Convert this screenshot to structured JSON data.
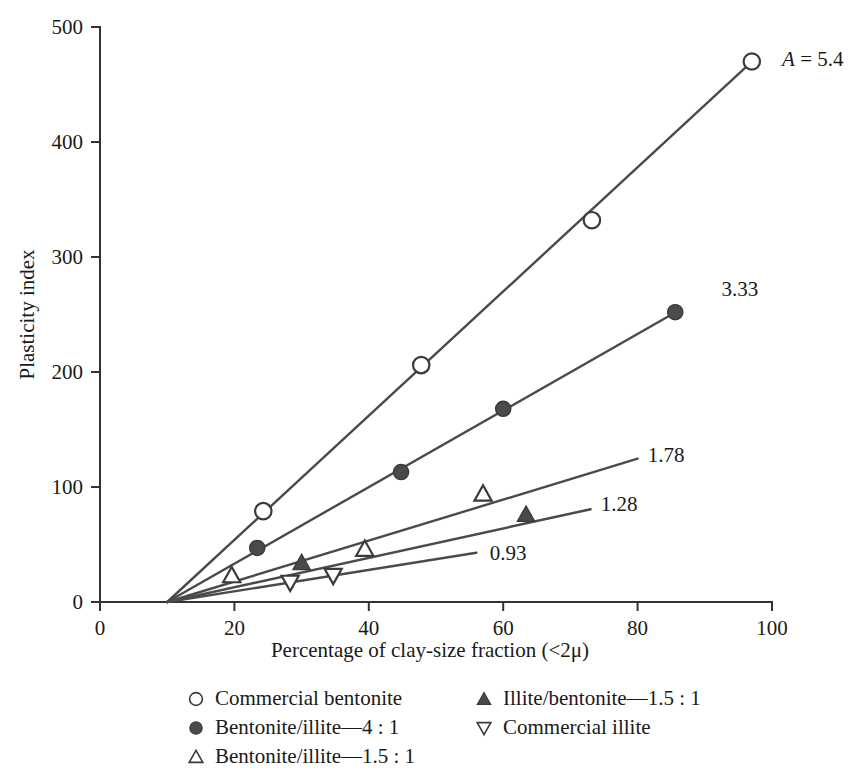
{
  "chart_data": {
    "type": "line",
    "title": "",
    "xlabel": "Percentage of clay-size fraction (<2μ)",
    "ylabel": "Plasticity index",
    "xlim": [
      0,
      100
    ],
    "ylim": [
      0,
      500
    ],
    "xticks": [
      0,
      20,
      40,
      60,
      80,
      100
    ],
    "yticks": [
      0,
      100,
      200,
      300,
      400,
      500
    ],
    "xtick_labels": [
      "0",
      "20",
      "40",
      "60",
      "80",
      "100"
    ],
    "ytick_labels": [
      "0",
      "100",
      "200",
      "300",
      "400",
      "500"
    ],
    "grid": false,
    "legend_position": "below-axes",
    "intercept_x": 10,
    "annotations": [
      {
        "text_italic": "A",
        "text_rest": " = 5.4",
        "x": 101.5,
        "y": 472,
        "full": "A = 5.4"
      },
      {
        "text_italic": "",
        "text_rest": "3.33",
        "x": 92.5,
        "y": 272,
        "full": "3.33"
      },
      {
        "text_italic": "",
        "text_rest": "1.78",
        "x": 81.5,
        "y": 128,
        "full": "1.78"
      },
      {
        "text_italic": "",
        "text_rest": "1.28",
        "x": 74.5,
        "y": 85,
        "full": "1.28"
      },
      {
        "text_italic": "",
        "text_rest": "0.93",
        "x": 58.0,
        "y": 43,
        "full": "0.93"
      }
    ],
    "series": [
      {
        "name": "Commercial bentonite",
        "activity": 5.4,
        "marker": "open-circle",
        "line_x": [
          10,
          97.0
        ],
        "points_x": [
          24.3,
          47.8,
          73.2,
          97.0
        ],
        "points_y": [
          79,
          206,
          332,
          470
        ]
      },
      {
        "name": "Bentonite/illite—4 : 1",
        "activity": 3.33,
        "marker": "filled-circle",
        "line_x": [
          10,
          86.5
        ],
        "points_x": [
          23.4,
          44.8,
          60.0,
          85.6
        ],
        "points_y": [
          47,
          113,
          168,
          252
        ]
      },
      {
        "name": "Bentonite/illite—1.5 : 1",
        "activity": 1.78,
        "marker": "open-triangle-up",
        "line_x": [
          10,
          80.0
        ],
        "points_x": [
          19.6,
          39.4,
          57.0
        ],
        "points_y": [
          23,
          46,
          94
        ]
      },
      {
        "name": "Illite/bentonite—1.5 : 1",
        "activity": 1.28,
        "marker": "filled-triangle-up",
        "line_x": [
          10,
          73.0
        ],
        "points_x": [
          30.0,
          63.4
        ],
        "points_y": [
          34,
          76
        ]
      },
      {
        "name": "Commercial illite",
        "activity": 0.93,
        "marker": "open-triangle-down",
        "line_x": [
          10,
          56.0
        ],
        "points_x": [
          28.3,
          34.7
        ],
        "points_y": [
          17,
          23
        ]
      }
    ]
  },
  "legend": {
    "column_left": [
      {
        "marker": "open-circle",
        "label": "Commercial bentonite"
      },
      {
        "marker": "filled-circle",
        "label": "Bentonite/illite—4 : 1"
      },
      {
        "marker": "open-triangle-up",
        "label": "Bentonite/illite—1.5 : 1"
      }
    ],
    "column_right": [
      {
        "marker": "filled-triangle-up",
        "label": "Illite/bentonite—1.5 : 1"
      },
      {
        "marker": "open-triangle-down",
        "label": "Commercial illite"
      }
    ]
  },
  "colors": {
    "background": "#ffffff",
    "axis": "#333333",
    "line": "#4a4a4a",
    "marker_fill": "#4a4a4a",
    "marker_open_fill": "#ffffff",
    "text": "#1a1a1a"
  }
}
